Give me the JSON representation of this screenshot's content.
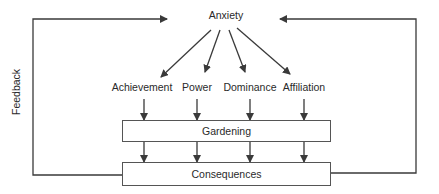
{
  "diagram": {
    "top_node": "Anxiety",
    "motives": [
      "Achievement",
      "Power",
      "Dominance",
      "Affiliation"
    ],
    "process_box": "Gardening",
    "outcome_box": "Consequences",
    "feedback_label": "Feedback",
    "colors": {
      "line": "#3a3a3a",
      "text": "#2a2a2a",
      "background": "#ffffff"
    },
    "edges": [
      {
        "from": "Anxiety",
        "to": "Achievement"
      },
      {
        "from": "Anxiety",
        "to": "Power"
      },
      {
        "from": "Anxiety",
        "to": "Dominance"
      },
      {
        "from": "Anxiety",
        "to": "Affiliation"
      },
      {
        "from": "Achievement",
        "to": "Gardening"
      },
      {
        "from": "Power",
        "to": "Gardening"
      },
      {
        "from": "Dominance",
        "to": "Gardening"
      },
      {
        "from": "Affiliation",
        "to": "Gardening"
      },
      {
        "from": "Gardening",
        "to": "Consequences"
      },
      {
        "from": "Consequences",
        "to": "Anxiety",
        "label": "Feedback",
        "side": "left"
      },
      {
        "from": "Consequences",
        "to": "Anxiety",
        "side": "right"
      }
    ]
  }
}
